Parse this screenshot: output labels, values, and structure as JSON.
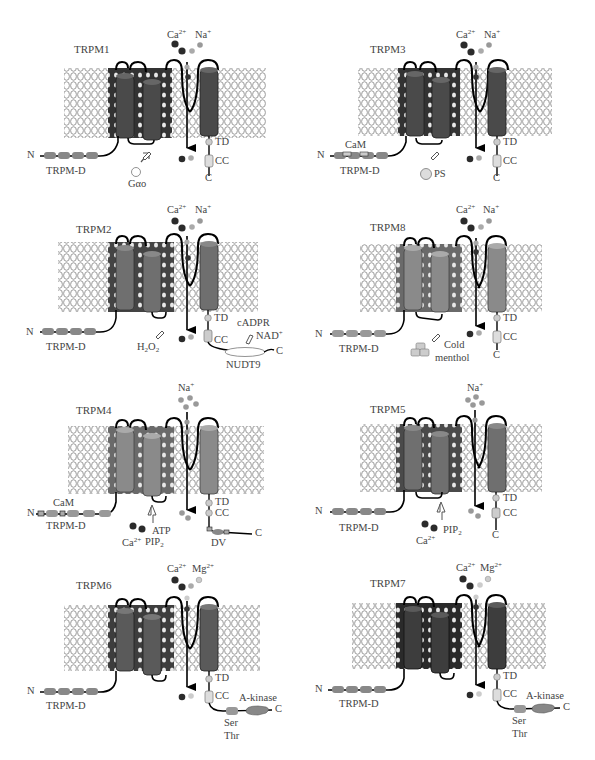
{
  "figure": {
    "panels": [
      {
        "id": "TRPM1",
        "title": "TRPM1",
        "ions": [
          "Ca",
          "Na"
        ],
        "helix_color": "#4a4a4a",
        "inner_color": "#333333",
        "labels": {
          "n": "N",
          "c": "C",
          "trpm_d": "TRPM-D",
          "td": "TD",
          "cc": "CC",
          "ion1": "Ca",
          "ion1_sup": "2+",
          "ion2": "Na",
          "ion2_sup": "+",
          "modulator": "Gαo"
        }
      },
      {
        "id": "TRPM3",
        "title": "TRPM3",
        "ions": [
          "Ca",
          "Na"
        ],
        "helix_color": "#4a4a4a",
        "inner_color": "#333333",
        "labels": {
          "n": "N",
          "c": "C",
          "trpm_d": "TRPM-D",
          "cam": "CaM",
          "td": "TD",
          "cc": "CC",
          "ion1": "Ca",
          "ion1_sup": "2+",
          "ion2": "Na",
          "ion2_sup": "+",
          "modulator": "PS"
        }
      },
      {
        "id": "TRPM2",
        "title": "TRPM2",
        "ions": [
          "Ca",
          "Na"
        ],
        "helix_color": "#6f6f6f",
        "inner_color": "#444444",
        "labels": {
          "n": "N",
          "c": "C",
          "trpm_d": "TRPM-D",
          "td": "TD",
          "cc": "CC",
          "ion1": "Ca",
          "ion1_sup": "2+",
          "ion2": "Na",
          "ion2_sup": "+",
          "modulator": "H2O2",
          "mod_main": "H",
          "mod_sub1": "2",
          "mod_o": "O",
          "mod_sub2": "2",
          "ligand1": "cADPR",
          "ligand2": "NAD",
          "ligand2_sup": "+",
          "domain": "NUDT9"
        }
      },
      {
        "id": "TRPM8",
        "title": "TRPM8",
        "ions": [
          "Ca",
          "Na"
        ],
        "helix_color": "#8a8a8a",
        "inner_color": "#6a6a6a",
        "labels": {
          "n": "N",
          "c": "C",
          "trpm_d": "TRPM-D",
          "td": "TD",
          "cc": "CC",
          "ion1": "Ca",
          "ion1_sup": "2+",
          "ion2": "Na",
          "ion2_sup": "+",
          "modulator1": "Cold",
          "modulator2": "menthol"
        }
      },
      {
        "id": "TRPM4",
        "title": "TRPM4",
        "ions": [
          "Na"
        ],
        "helix_color": "#8a8a8a",
        "inner_color": "#6a6a6a",
        "labels": {
          "n": "N",
          "c": "C",
          "trpm_d": "TRPM-D",
          "cam": "CaM",
          "td": "TD",
          "cc": "CC",
          "ion1": "Na",
          "ion1_sup": "+",
          "mod_ca": "Ca",
          "mod_ca_sup": "2+",
          "mod_atp": "ATP",
          "mod_pip": "PIP",
          "mod_pip_sub": "2",
          "domain": "DV"
        }
      },
      {
        "id": "TRPM5",
        "title": "TRPM5",
        "ions": [
          "Na"
        ],
        "helix_color": "#6f6f6f",
        "inner_color": "#4a4a4a",
        "labels": {
          "n": "N",
          "c": "C",
          "trpm_d": "TRPM-D",
          "td": "TD",
          "cc": "CC",
          "ion1": "Na",
          "ion1_sup": "+",
          "mod_ca": "Ca",
          "mod_ca_sup": "2+",
          "mod_pip": "PIP",
          "mod_pip_sub": "2"
        }
      },
      {
        "id": "TRPM6",
        "title": "TRPM6",
        "ions": [
          "Ca",
          "Mg"
        ],
        "helix_color": "#5a5a5a",
        "inner_color": "#3d3d3d",
        "labels": {
          "n": "N",
          "c": "C",
          "trpm_d": "TRPM-D",
          "td": "TD",
          "cc": "CC",
          "ion1": "Ca",
          "ion1_sup": "2+",
          "ion2": "Mg",
          "ion2_sup": "2+",
          "kinase": "A-kinase",
          "ser": "Ser",
          "thr": "Thr"
        }
      },
      {
        "id": "TRPM7",
        "title": "TRPM7",
        "ions": [
          "Ca",
          "Mg"
        ],
        "helix_color": "#3d3d3d",
        "inner_color": "#2a2a2a",
        "labels": {
          "n": "N",
          "c": "C",
          "trpm_d": "TRPM-D",
          "td": "TD",
          "cc": "CC",
          "ion1": "Ca",
          "ion1_sup": "2+",
          "ion2": "Mg",
          "ion2_sup": "2+",
          "kinase": "A-kinase",
          "ser": "Ser",
          "thr": "Thr"
        }
      }
    ],
    "colors": {
      "membrane": "#9a9a9a",
      "ion_dark": "#2b2b2b",
      "ion_mid": "#8a8a8a",
      "ion_light": "#c8c8c8",
      "text": "#444444"
    }
  }
}
